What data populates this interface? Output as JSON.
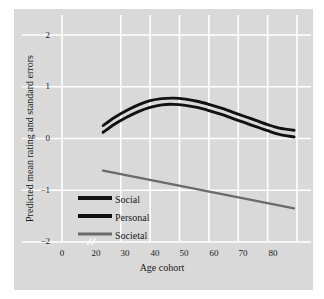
{
  "chart_data": {
    "type": "line",
    "title": "",
    "subtitle": "",
    "xlabel": "Age cohort",
    "ylabel": "Predicted mean rating and standard errors",
    "xlim": [
      0,
      80
    ],
    "ylim": [
      -2,
      2
    ],
    "x_ticks": [
      "0",
      "20",
      "30",
      "40",
      "50",
      "60",
      "70",
      "80"
    ],
    "x_tick_values": [
      0,
      20,
      30,
      40,
      50,
      60,
      70,
      80
    ],
    "y_ticks": [
      "2",
      "1",
      "0",
      "−1",
      "−2"
    ],
    "y_tick_values": [
      2,
      1,
      0,
      -1,
      -2
    ],
    "grid": true,
    "x_axis_break": "//",
    "legend_position": "lower-left-inside",
    "legend": [
      "Social",
      "Personal",
      "Societal"
    ],
    "colors": {
      "social": "#111111",
      "personal": "#111111",
      "societal": "#6b6b6b",
      "panel_background": "#d9d9d9",
      "gridline": "#ffffff",
      "figure_background": "#ffffff",
      "text": "#1a1a1a"
    },
    "series": [
      {
        "name": "Social",
        "color": "#111111",
        "x": [
          14,
          18,
          22,
          26,
          30,
          34,
          38,
          42,
          46,
          50,
          54,
          58,
          62,
          66,
          70,
          74,
          79
        ],
        "values": [
          0.25,
          0.41,
          0.54,
          0.65,
          0.73,
          0.77,
          0.78,
          0.76,
          0.72,
          0.66,
          0.59,
          0.51,
          0.43,
          0.35,
          0.27,
          0.2,
          0.16
        ]
      },
      {
        "name": "Personal",
        "color": "#111111",
        "x": [
          14,
          18,
          22,
          26,
          30,
          34,
          38,
          42,
          46,
          50,
          54,
          58,
          62,
          66,
          70,
          74,
          79
        ],
        "values": [
          0.12,
          0.28,
          0.41,
          0.52,
          0.6,
          0.65,
          0.66,
          0.64,
          0.6,
          0.54,
          0.47,
          0.39,
          0.31,
          0.23,
          0.15,
          0.08,
          0.03
        ]
      },
      {
        "name": "Societal",
        "color": "#6b6b6b",
        "x": [
          14,
          79
        ],
        "values": [
          -0.62,
          -1.35
        ]
      }
    ]
  },
  "legend_items": [
    {
      "label": "Social",
      "color": "#111111",
      "thickness": 4
    },
    {
      "label": "Personal",
      "color": "#111111",
      "thickness": 4
    },
    {
      "label": "Societal",
      "color": "#6b6b6b",
      "thickness": 3
    }
  ]
}
